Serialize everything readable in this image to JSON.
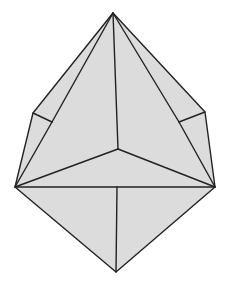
{
  "figure": {
    "fill_color": "#dcdcdc",
    "stroke_color": "#222222",
    "vertices": {
      "apex": [
        113,
        13
      ],
      "left_outer": [
        33,
        113
      ],
      "left_inner": [
        52,
        122
      ],
      "right_outer": [
        205,
        112
      ],
      "right_inner": [
        179,
        122
      ],
      "left_equator": [
        15,
        187
      ],
      "right_equator": [
        215,
        187
      ],
      "center": [
        118,
        149
      ],
      "equator_mid": [
        117,
        187
      ],
      "bottom": [
        116,
        272
      ]
    }
  }
}
